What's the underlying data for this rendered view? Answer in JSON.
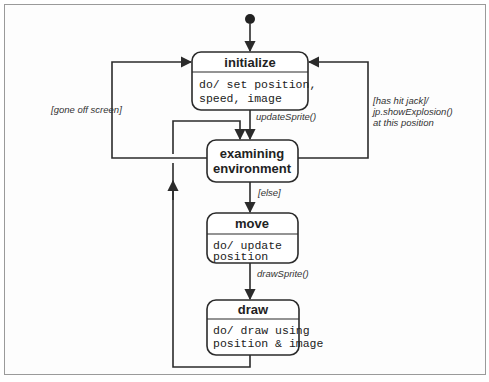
{
  "diagram": {
    "type": "UML state machine",
    "initial_state": "initialize",
    "states": [
      {
        "id": "initialize",
        "title": "initialize",
        "activity": [
          "do/ set position,",
          "speed, image"
        ]
      },
      {
        "id": "examining",
        "title": [
          "examining",
          "environment"
        ],
        "activity": []
      },
      {
        "id": "move",
        "title": "move",
        "activity": [
          "do/ update",
          "position"
        ]
      },
      {
        "id": "draw",
        "title": "draw",
        "activity": [
          "do/ draw using",
          "position & image"
        ]
      }
    ],
    "transitions": [
      {
        "from": "initial",
        "to": "initialize",
        "label": ""
      },
      {
        "from": "initialize",
        "to": "examining",
        "label": "updateSprite()"
      },
      {
        "from": "examining",
        "to": "initialize",
        "label": "[gone off screen]"
      },
      {
        "from": "examining",
        "to": "initialize",
        "label": [
          "[has hit jack]/",
          "jp.showExplosion()",
          "at this position"
        ]
      },
      {
        "from": "examining",
        "to": "move",
        "label": "[else]"
      },
      {
        "from": "move",
        "to": "draw",
        "label": "drawSprite()"
      },
      {
        "from": "draw",
        "to": "examining",
        "label": ""
      }
    ]
  }
}
